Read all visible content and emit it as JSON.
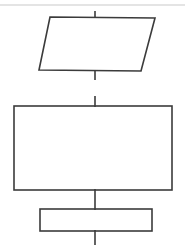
{
  "diagram": {
    "type": "flowchart",
    "background_color": "#ffffff",
    "stroke_color": "#3b3b3b",
    "stroke_width": 1.6,
    "canvas": {
      "width": 185,
      "height": 249
    },
    "artifact": {
      "name": "scan-edge-line",
      "color": "#c9c9c9",
      "stroke_width": 1.2,
      "x1": 0,
      "y1": 5,
      "x2": 185,
      "y2": 5
    },
    "nodes": [
      {
        "id": "node-1",
        "name": "parallelogram-input-output",
        "shape": "parallelogram",
        "label": "",
        "points": "50,17 155,18 141,71 39,70",
        "bbox": {
          "x": 39,
          "y": 17,
          "width": 116,
          "height": 54
        }
      },
      {
        "id": "node-2",
        "name": "rectangle-process-large",
        "shape": "rectangle",
        "label": "",
        "bbox": {
          "x": 14,
          "y": 106,
          "width": 158,
          "height": 84
        }
      },
      {
        "id": "node-3",
        "name": "rectangle-process-small",
        "shape": "rectangle",
        "label": "",
        "bbox": {
          "x": 40,
          "y": 209,
          "width": 112,
          "height": 22
        }
      }
    ],
    "connectors": [
      {
        "id": "conn-0",
        "name": "connector-top-entry",
        "x1": 95,
        "y1": 11,
        "x2": 95,
        "y2": 18
      },
      {
        "id": "conn-1",
        "name": "connector-node1-exit",
        "x1": 95,
        "y1": 70,
        "x2": 95,
        "y2": 80
      },
      {
        "id": "conn-2",
        "name": "connector-node2-entry",
        "x1": 95,
        "y1": 96,
        "x2": 95,
        "y2": 107
      },
      {
        "id": "conn-3",
        "name": "connector-node2-to-node3",
        "x1": 95,
        "y1": 189,
        "x2": 95,
        "y2": 210
      },
      {
        "id": "conn-4",
        "name": "connector-node3-exit",
        "x1": 95,
        "y1": 230,
        "x2": 95,
        "y2": 245
      }
    ]
  }
}
